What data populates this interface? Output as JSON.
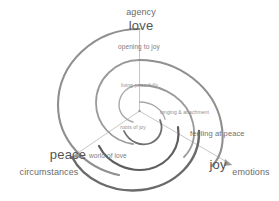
{
  "diagram": {
    "type": "spiral-triskelion",
    "colors": {
      "arc_light": "#9a9a9a",
      "arc_mid": "#7d7d7d",
      "arc_dark": "#5e5e5e",
      "radial_line": "#b5b5b5",
      "text_primary": "#555555",
      "text_secondary": "#6b6b6b",
      "text_inner": "#8e8e8e",
      "background": "#ffffff"
    },
    "primary_labels": [
      {
        "key": "love",
        "text": "love"
      },
      {
        "key": "peace",
        "text": "peace"
      },
      {
        "key": "joy",
        "text": "joy"
      }
    ],
    "context_labels": [
      {
        "key": "agency",
        "text": "agency"
      },
      {
        "key": "circumstances",
        "text": "circumstances"
      },
      {
        "key": "emotions",
        "text": "emotions"
      }
    ],
    "inner_labels": [
      {
        "key": "opening_to_joy",
        "text": "opening to joy"
      },
      {
        "key": "living_peacefully",
        "text": "living peacefully"
      },
      {
        "key": "longing_attachment",
        "text": "longing & attachment"
      },
      {
        "key": "roots_of_joy",
        "text": "roots of joy"
      },
      {
        "key": "world_of_love",
        "text": "world of love"
      },
      {
        "key": "feeling_at_peace",
        "text": "feeling at peace"
      }
    ]
  },
  "labels": {
    "agency": "agency",
    "love": "love",
    "opening_to_joy": "opening to joy",
    "living_peacefully": "living peacefully",
    "longing_attachment": "longing & attachment",
    "roots_of_joy": "roots of joy",
    "world_of_love": "world of love",
    "feeling_at_peace": "feeling at peace",
    "peace": "peace",
    "circumstances": "circumstances",
    "joy": "joy",
    "emotions": "emotions"
  }
}
